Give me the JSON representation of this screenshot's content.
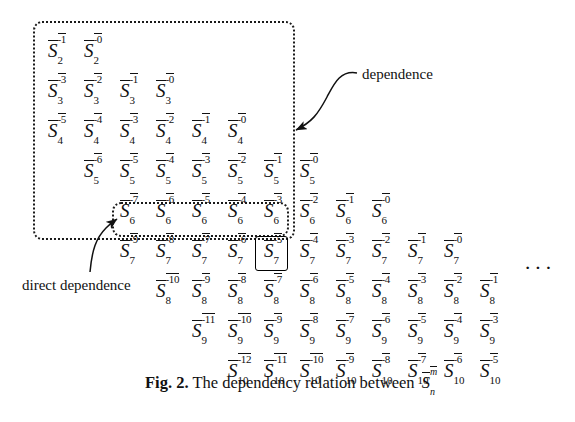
{
  "figure": {
    "caption_label": "Fig. 2.",
    "caption_text": "The dependency relation between",
    "caption_symbol": {
      "base": "S",
      "sup": "m",
      "sub": "n"
    },
    "ellipsis": "···"
  },
  "annotations": [
    {
      "name": "dependence",
      "label": "dependence"
    },
    {
      "name": "direct-dependence",
      "label": "direct dependence"
    }
  ],
  "colors": {
    "ink": "#111111",
    "background": "#ffffff",
    "dotted_box": "#1a1a1a",
    "solid_box": "#000000"
  },
  "grid": {
    "description": "Triangular array of symbols S with overline, superscript -k and subscript n",
    "col_step": 36,
    "row_step": 40,
    "origin_x": 48,
    "origin_y": 40,
    "rows": [
      {
        "n": "2",
        "start_col": 0,
        "sups": [
          "-1",
          "-0"
        ]
      },
      {
        "n": "3",
        "start_col": 0,
        "sups": [
          "-3",
          "-2",
          "-1",
          "-0"
        ]
      },
      {
        "n": "4",
        "start_col": 0,
        "sups": [
          "-5",
          "-4",
          "-3",
          "-2",
          "-1",
          "-0"
        ]
      },
      {
        "n": "5",
        "start_col": 1,
        "sups": [
          "-6",
          "-5",
          "-4",
          "-3",
          "-2",
          "-1",
          "-0"
        ]
      },
      {
        "n": "6",
        "start_col": 2,
        "sups": [
          "-7",
          "-6",
          "-5",
          "-4",
          "-3",
          "-2",
          "-1",
          "-0"
        ]
      },
      {
        "n": "7",
        "start_col": 2,
        "sups": [
          "-9",
          "-8",
          "-7",
          "-6",
          "-5",
          "-4",
          "-3",
          "-2",
          "-1",
          "-0"
        ]
      },
      {
        "n": "8",
        "start_col": 3,
        "sups": [
          "-10",
          "-9",
          "-8",
          "-7",
          "-6",
          "-5",
          "-4",
          "-3",
          "-2",
          "-1"
        ]
      },
      {
        "n": "9",
        "start_col": 4,
        "sups": [
          "-11",
          "-10",
          "-9",
          "-8",
          "-7",
          "-6",
          "-5",
          "-4",
          "-3"
        ]
      },
      {
        "n": "10",
        "start_col": 5,
        "sups": [
          "-12",
          "-11",
          "-10",
          "-9",
          "-8",
          "-7",
          "-6",
          "-5"
        ]
      }
    ]
  },
  "highlights": {
    "outer_dotted_box": {
      "name": "dependence-region",
      "x": 33,
      "y": 21,
      "w": 258,
      "h": 215
    },
    "inner_dotted_box": {
      "name": "direct-dependence-region",
      "x": 112,
      "y": 202,
      "w": 173,
      "h": 31
    },
    "solid_box": {
      "name": "selected-element-box",
      "x": 255,
      "y": 236,
      "w": 31,
      "h": 33
    }
  }
}
